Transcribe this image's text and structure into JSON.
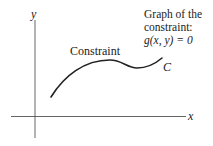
{
  "diagram": {
    "axes": {
      "x_label": "x",
      "y_label": "y"
    },
    "curve": {
      "label": "Constraint",
      "name": "C"
    },
    "annotation": {
      "line1": "Graph of the",
      "line2": "constraint:",
      "line3": "g(x, y) = 0"
    },
    "colors": {
      "stroke": "#222222",
      "axis": "#555555",
      "background": "#ffffff"
    }
  }
}
